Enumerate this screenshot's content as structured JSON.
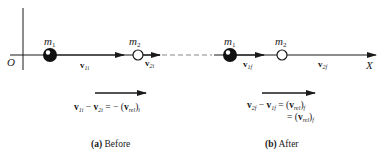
{
  "diagram": {
    "origin_label": "O",
    "axis_label": "X",
    "colors": {
      "ink": "#1a1a1a",
      "dash": "#888888",
      "background": "#ffffff"
    }
  },
  "before": {
    "m1_label": "m",
    "m1_sub": "1",
    "m2_label": "m",
    "m2_sub": "2",
    "v1_label": "v",
    "v1_sub": "1i",
    "v2_label": "v",
    "v2_sub": "2i",
    "equation": {
      "lhs_a": "v",
      "lhs_a_sub": "1i",
      "minus": " − ",
      "lhs_b": "v",
      "lhs_b_sub": "2i",
      "equals": " = − (",
      "rhs": "v",
      "rhs_sub": "rel",
      "close": ")",
      "close_sub": "i"
    },
    "caption_tag": "(a)",
    "caption_text": " Before"
  },
  "after": {
    "m1_label": "m",
    "m1_sub": "1",
    "m2_label": "m",
    "m2_sub": "2",
    "v1_label": "v",
    "v1_sub": "1f",
    "v2_label": "v",
    "v2_sub": "2f",
    "equation_line1": {
      "lhs_a": "v",
      "lhs_a_sub": "2f",
      "minus": " − ",
      "lhs_b": "v",
      "lhs_b_sub": "1f",
      "equals": " = (",
      "rhs": "v",
      "rhs_sub": "rel",
      "close": ")",
      "close_sub": "f"
    },
    "equation_line2": {
      "equals": "= (",
      "rhs": "v",
      "rhs_sub": "rel",
      "close": ")",
      "close_sub": "f"
    },
    "caption_tag": "(b)",
    "caption_text": " After"
  }
}
